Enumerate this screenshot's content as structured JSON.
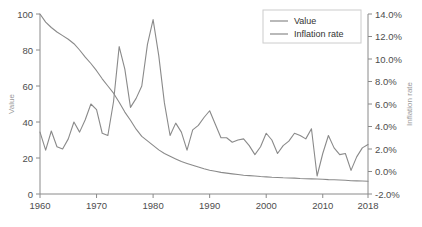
{
  "chart_data": {
    "type": "line",
    "title": "",
    "xlabel": "",
    "grid": false,
    "legend_position": "top-right",
    "x_axis": {
      "ticks": [
        1960,
        1970,
        1980,
        1990,
        2000,
        2010,
        2018
      ],
      "tick_labels": [
        "1960",
        "1970",
        "1980",
        "1990",
        "2000",
        "2010",
        "2018"
      ],
      "xlim": [
        1960,
        2018
      ]
    },
    "y_axis_left": {
      "label": "Value",
      "ticks": [
        0,
        20,
        40,
        60,
        80,
        100
      ],
      "tick_labels": [
        "0",
        "20",
        "40",
        "60",
        "80",
        "100"
      ],
      "ylim": [
        0,
        100
      ],
      "color": "#9a9a9a"
    },
    "y_axis_right": {
      "label": "Inflation rate",
      "ticks": [
        -2,
        0,
        2,
        4,
        6,
        8,
        10,
        12,
        14
      ],
      "tick_labels": [
        "-2.0%",
        "0.0%",
        "2.0%",
        "4.0%",
        "6.0%",
        "8.0%",
        "10.0%",
        "12.0%",
        "14.0%"
      ],
      "ylim": [
        -2,
        14
      ],
      "color": "#9a9a9a"
    },
    "x": [
      1960,
      1961,
      1962,
      1963,
      1964,
      1965,
      1966,
      1967,
      1968,
      1969,
      1970,
      1971,
      1972,
      1973,
      1974,
      1975,
      1976,
      1977,
      1978,
      1979,
      1980,
      1981,
      1982,
      1983,
      1984,
      1985,
      1986,
      1987,
      1988,
      1989,
      1990,
      1991,
      1992,
      1993,
      1994,
      1995,
      1996,
      1997,
      1998,
      1999,
      2000,
      2001,
      2002,
      2003,
      2004,
      2005,
      2006,
      2007,
      2008,
      2009,
      2010,
      2011,
      2012,
      2013,
      2014,
      2015,
      2016,
      2017,
      2018
    ],
    "series": [
      {
        "name": "Value",
        "axis": "left",
        "color": "#8a8a8a",
        "values": [
          100,
          95.5,
          92.5,
          90.0,
          88.0,
          86.0,
          83.5,
          80.0,
          76.0,
          72.5,
          68.5,
          64.0,
          60.0,
          56.0,
          51.0,
          45.5,
          41.0,
          36.0,
          32.0,
          29.5,
          27.0,
          24.5,
          22.5,
          21.0,
          19.5,
          18.0,
          17.0,
          16.0,
          15.0,
          14.0,
          13.2,
          12.6,
          12.0,
          11.6,
          11.2,
          10.8,
          10.4,
          10.2,
          10.0,
          9.7,
          9.5,
          9.3,
          9.2,
          9.0,
          8.9,
          8.8,
          8.6,
          8.5,
          8.4,
          8.3,
          8.2,
          8.0,
          7.9,
          7.8,
          7.6,
          7.4,
          7.3,
          7.2,
          7.1
        ]
      },
      {
        "name": "Inflation rate",
        "axis": "right",
        "color": "#8a8a8a",
        "values": [
          3.5,
          1.9,
          3.6,
          2.2,
          2.0,
          2.9,
          4.4,
          3.5,
          4.6,
          6.0,
          5.5,
          3.4,
          3.2,
          6.2,
          11.1,
          9.1,
          5.7,
          6.5,
          7.6,
          11.3,
          13.5,
          10.3,
          6.1,
          3.2,
          4.3,
          3.5,
          1.9,
          3.7,
          4.1,
          4.8,
          5.4,
          4.2,
          3.0,
          3.0,
          2.6,
          2.8,
          2.9,
          2.3,
          1.5,
          2.2,
          3.4,
          2.8,
          1.6,
          2.3,
          2.7,
          3.4,
          3.2,
          2.9,
          3.8,
          -0.4,
          1.6,
          3.2,
          2.1,
          1.5,
          1.6,
          0.1,
          1.3,
          2.1,
          2.4
        ]
      }
    ],
    "legend": [
      {
        "label": "Value",
        "color": "#8a8a8a"
      },
      {
        "label": "Inflation rate",
        "color": "#8a8a8a"
      }
    ]
  },
  "colors": {
    "axis": "#8a8a8a",
    "tick_text": "#4d4d4d",
    "axis_title": "#9a9a9a",
    "legend_border": "#cccccc",
    "background": "#ffffff"
  }
}
